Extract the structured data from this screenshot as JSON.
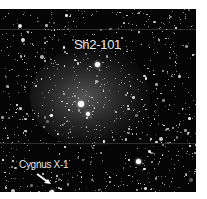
{
  "image": {
    "description": "Black-and-white astronomical star field with a faint diffuse nebula",
    "background_color": "#050505",
    "star_color": "#ffffff"
  },
  "labels": {
    "nebula_name": "Sh2-101",
    "source_name": "Cygnus X-1"
  },
  "annotations": {
    "arrow_target": "Cygnus X-1",
    "arrow_color": "#ffffff"
  }
}
